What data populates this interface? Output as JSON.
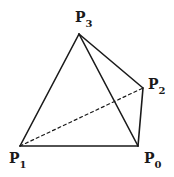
{
  "diagram": {
    "type": "tetrahedron",
    "stroke_color": "#1a1a1a",
    "background": "#ffffff",
    "vertices": [
      {
        "id": "P0",
        "letter": "P",
        "subscript": "0",
        "x": 138,
        "y": 146,
        "label_x": 144,
        "label_y": 163
      },
      {
        "id": "P1",
        "letter": "P",
        "subscript": "1",
        "x": 20,
        "y": 146,
        "label_x": 9,
        "label_y": 163
      },
      {
        "id": "P2",
        "letter": "P",
        "subscript": "2",
        "x": 143,
        "y": 88,
        "label_x": 148,
        "label_y": 89
      },
      {
        "id": "P3",
        "letter": "P",
        "subscript": "3",
        "x": 79,
        "y": 34,
        "label_x": 75,
        "label_y": 22
      }
    ],
    "edges": [
      {
        "from": "P1",
        "to": "P0",
        "style": "solid"
      },
      {
        "from": "P1",
        "to": "P3",
        "style": "solid"
      },
      {
        "from": "P3",
        "to": "P0",
        "style": "solid"
      },
      {
        "from": "P3",
        "to": "P2",
        "style": "solid"
      },
      {
        "from": "P2",
        "to": "P0",
        "style": "solid"
      },
      {
        "from": "P1",
        "to": "P2",
        "style": "dashed"
      }
    ]
  }
}
